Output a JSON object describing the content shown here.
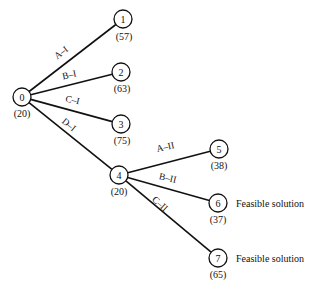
{
  "diagram": {
    "type": "branch-and-bound tree",
    "nodes": [
      {
        "id": "0",
        "label": "0",
        "value": "(20)",
        "x": 22,
        "y": 97,
        "vx": 22,
        "vy": 117,
        "note": ""
      },
      {
        "id": "1",
        "label": "1",
        "value": "(57)",
        "x": 123,
        "y": 19,
        "vx": 124,
        "vy": 40,
        "note": ""
      },
      {
        "id": "2",
        "label": "2",
        "value": "(63)",
        "x": 121,
        "y": 72,
        "vx": 122,
        "vy": 92,
        "note": ""
      },
      {
        "id": "3",
        "label": "3",
        "value": "(75)",
        "x": 121,
        "y": 124,
        "vx": 122,
        "vy": 144,
        "note": ""
      },
      {
        "id": "4",
        "label": "4",
        "value": "(20)",
        "x": 119,
        "y": 175,
        "vx": 119,
        "vy": 195,
        "note": ""
      },
      {
        "id": "5",
        "label": "5",
        "value": "(38)",
        "x": 219,
        "y": 149,
        "vx": 219,
        "vy": 169,
        "note": ""
      },
      {
        "id": "6",
        "label": "6",
        "value": "(37)",
        "x": 218,
        "y": 203,
        "vx": 218,
        "vy": 223,
        "note": "Feasible solution"
      },
      {
        "id": "7",
        "label": "7",
        "value": "(65)",
        "x": 218,
        "y": 258,
        "vx": 218,
        "vy": 278,
        "note": "Feasible solution"
      }
    ],
    "edges": [
      {
        "from": "0",
        "to": "1",
        "label": "A–I",
        "lx": 63,
        "ly": 55,
        "rot": -38
      },
      {
        "from": "0",
        "to": "2",
        "label": "B–I",
        "lx": 70,
        "ly": 78,
        "rot": -13
      },
      {
        "from": "0",
        "to": "3",
        "label": "C–I",
        "lx": 72,
        "ly": 103,
        "rot": 12
      },
      {
        "from": "0",
        "to": "4",
        "label": "D–I",
        "lx": 67,
        "ly": 127,
        "rot": 40
      },
      {
        "from": "4",
        "to": "5",
        "label": "A–II",
        "lx": 166,
        "ly": 150,
        "rot": -13
      },
      {
        "from": "4",
        "to": "6",
        "label": "B–II",
        "lx": 167,
        "ly": 181,
        "rot": 13
      },
      {
        "from": "4",
        "to": "7",
        "label": "C–II",
        "lx": 158,
        "ly": 206,
        "rot": 42
      }
    ]
  }
}
